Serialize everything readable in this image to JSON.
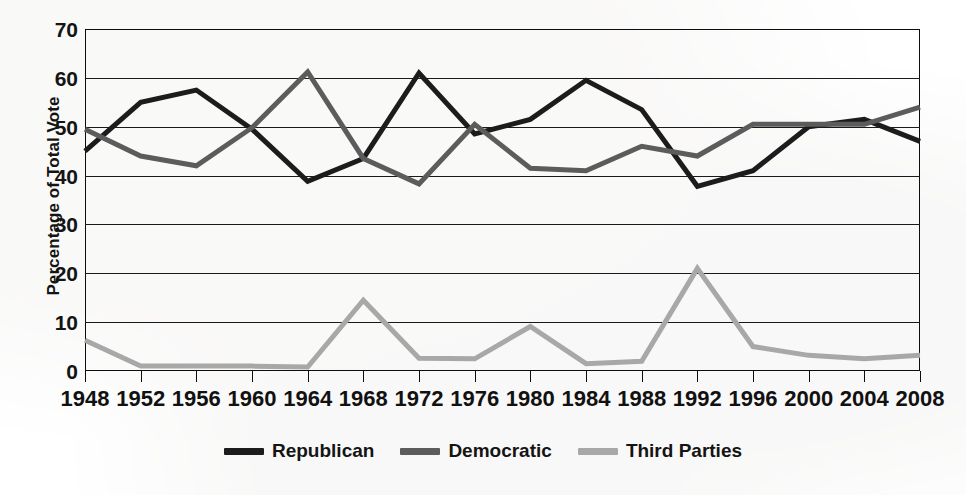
{
  "chart_data": {
    "type": "line",
    "title": "",
    "xlabel": "",
    "ylabel": "Percentage of Total Vote",
    "x": [
      1948,
      1952,
      1956,
      1960,
      1964,
      1968,
      1972,
      1976,
      1980,
      1984,
      1988,
      1992,
      1996,
      2000,
      2004,
      2008
    ],
    "categories": [
      "1948",
      "1952",
      "1956",
      "1960",
      "1964",
      "1968",
      "1972",
      "1976",
      "1980",
      "1984",
      "1988",
      "1992",
      "1996",
      "2000",
      "2004",
      "2008"
    ],
    "ylim": [
      0,
      70
    ],
    "yticks": [
      0,
      10,
      20,
      30,
      40,
      50,
      60,
      70
    ],
    "ytick_labels": [
      "0",
      "10",
      "20",
      "30",
      "40",
      "50",
      "60",
      "70"
    ],
    "grid": true,
    "legend_position": "bottom-center",
    "series": [
      {
        "name": "Republican",
        "color": "#1c1c1c",
        "values": [
          45.0,
          55.0,
          57.5,
          49.5,
          38.8,
          43.5,
          61.0,
          48.5,
          51.5,
          59.5,
          53.5,
          37.8,
          41.0,
          50.0,
          51.5,
          47.0
        ]
      },
      {
        "name": "Democratic",
        "color": "#5c5c5c",
        "values": [
          49.5,
          44.0,
          42.0,
          49.8,
          61.2,
          43.5,
          38.3,
          50.5,
          41.5,
          41.0,
          46.0,
          44.0,
          50.5,
          50.5,
          50.5,
          54.0
        ]
      },
      {
        "name": "Third Parties",
        "color": "#a8a8a8",
        "values": [
          6.3,
          1.0,
          1.0,
          1.0,
          0.8,
          14.5,
          2.6,
          2.5,
          9.1,
          1.5,
          2.0,
          21.0,
          5.0,
          3.2,
          2.5,
          3.2
        ]
      }
    ]
  },
  "legend": {
    "items": [
      {
        "label": "Republican",
        "color": "#1c1c1c"
      },
      {
        "label": "Democratic",
        "color": "#5c5c5c"
      },
      {
        "label": "Third Parties",
        "color": "#a8a8a8"
      }
    ]
  },
  "axes": {
    "y_title": "Percentage of Total Vote"
  }
}
